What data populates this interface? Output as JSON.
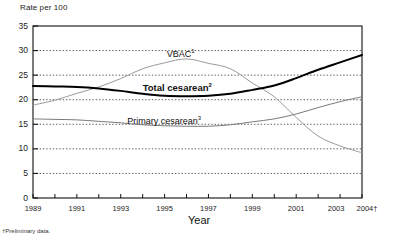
{
  "figure": {
    "ylabel_title": "Rate per 100",
    "xlabel_title": "Year",
    "footnote": "†Preliminary data."
  },
  "axes": {
    "y_ticks": [
      "0",
      "5",
      "10",
      "15",
      "20",
      "25",
      "30",
      "35"
    ],
    "x_ticks": [
      "1989",
      "1991",
      "1993",
      "1995",
      "1997",
      "1999",
      "2001",
      "2003",
      "2004†"
    ]
  },
  "series_labels": {
    "vbac": "VBAC",
    "vbac_sup": "1",
    "total": "Total cesarean",
    "total_sup": "2",
    "primary": "Primary cesarean",
    "primary_sup": "3"
  },
  "colors": {
    "total_cesarean": "#000000",
    "primary_cesarean": "#7a7a7a",
    "vbac": "#9a9a9a",
    "grid": "#333333",
    "axis": "#111111"
  },
  "chart_data": {
    "type": "line",
    "title": "",
    "xlabel": "Year",
    "ylabel": "Rate per 100",
    "ylim": [
      0,
      35
    ],
    "xlim": [
      1989,
      2004
    ],
    "grid": true,
    "legend": "inline-annotations",
    "x": [
      1989,
      1990,
      1991,
      1992,
      1993,
      1994,
      1995,
      1996,
      1997,
      1998,
      1999,
      2000,
      2001,
      2002,
      2003,
      2004
    ],
    "x_tick_labels": [
      "1989",
      "",
      "1991",
      "",
      "1993",
      "",
      "1995",
      "",
      "1997",
      "",
      "1999",
      "",
      "2001",
      "",
      "2003",
      "2004†"
    ],
    "y_ticks": [
      0,
      5,
      10,
      15,
      20,
      25,
      30,
      35
    ],
    "series": [
      {
        "name": "Total cesarean",
        "superscript": "2",
        "color": "#000000",
        "style": "bold-solid",
        "values": [
          22.8,
          22.7,
          22.6,
          22.3,
          21.8,
          21.2,
          20.8,
          20.7,
          20.8,
          21.2,
          22.0,
          22.9,
          24.4,
          26.1,
          27.6,
          29.1
        ]
      },
      {
        "name": "Primary cesarean",
        "superscript": "3",
        "color": "#7a7a7a",
        "style": "thin-solid",
        "values": [
          16.1,
          16.0,
          15.9,
          15.6,
          15.3,
          14.9,
          14.7,
          14.6,
          14.6,
          14.9,
          15.5,
          16.1,
          17.1,
          18.4,
          19.6,
          20.6
        ]
      },
      {
        "name": "VBAC",
        "superscript": "1",
        "color": "#9a9a9a",
        "style": "thin-solid",
        "values": [
          18.9,
          19.9,
          21.3,
          22.6,
          24.3,
          26.3,
          27.5,
          28.3,
          27.4,
          26.3,
          23.4,
          20.6,
          16.4,
          12.6,
          10.6,
          9.2
        ]
      }
    ]
  }
}
